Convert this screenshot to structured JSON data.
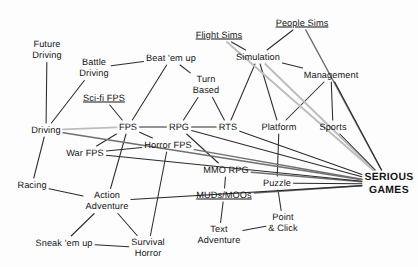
{
  "diagram": {
    "colors": {
      "text": "#141414",
      "edge_dark": "#2b2b2b",
      "edge_mid": "#6f6f6f",
      "edge_light": "#bdbdbd",
      "background": "#fdfdfd"
    },
    "nodes": [
      {
        "id": "future_driving",
        "label": "Future\nDriving",
        "x": 47,
        "y": 50,
        "style": "plain"
      },
      {
        "id": "battle_driving",
        "label": "Battle\nDriving",
        "x": 94,
        "y": 68,
        "style": "plain"
      },
      {
        "id": "beat_em_up",
        "label": "Beat 'em up",
        "x": 171,
        "y": 58,
        "style": "plain"
      },
      {
        "id": "flight_sims",
        "label": "Flight Sims",
        "x": 219,
        "y": 35,
        "style": "underline-partial"
      },
      {
        "id": "people_sims",
        "label": "People Sims",
        "x": 302,
        "y": 23,
        "style": "underline-partial"
      },
      {
        "id": "simulation",
        "label": "Simulation",
        "x": 258,
        "y": 57,
        "style": "plain"
      },
      {
        "id": "management",
        "label": "Management",
        "x": 331,
        "y": 75,
        "style": "plain"
      },
      {
        "id": "turn_based",
        "label": "Turn\nBased",
        "x": 206,
        "y": 85,
        "style": "plain"
      },
      {
        "id": "scifi_fps",
        "label": "Sci-fi FPS",
        "x": 104,
        "y": 98,
        "style": "underline"
      },
      {
        "id": "driving",
        "label": "Driving",
        "x": 46,
        "y": 130,
        "style": "plain"
      },
      {
        "id": "fps",
        "label": "FPS",
        "x": 128,
        "y": 127,
        "style": "plain"
      },
      {
        "id": "rpg",
        "label": "RPG",
        "x": 179,
        "y": 127,
        "style": "plain"
      },
      {
        "id": "rts",
        "label": "RTS",
        "x": 228,
        "y": 127,
        "style": "plain"
      },
      {
        "id": "platform",
        "label": "Platform",
        "x": 279,
        "y": 127,
        "style": "plain"
      },
      {
        "id": "sports",
        "label": "Sports",
        "x": 333,
        "y": 127,
        "style": "plain"
      },
      {
        "id": "war_fps",
        "label": "War FPS",
        "x": 85,
        "y": 153,
        "style": "plain"
      },
      {
        "id": "horror_fps",
        "label": "Horror FPS",
        "x": 168,
        "y": 145,
        "style": "plain"
      },
      {
        "id": "mmo_rpg",
        "label": "MMO RPG",
        "x": 226,
        "y": 170,
        "style": "plain"
      },
      {
        "id": "puzzle",
        "label": "Puzzle",
        "x": 277,
        "y": 183,
        "style": "plain"
      },
      {
        "id": "serious_games",
        "label": "SERIOUS\nGAMES",
        "x": 389,
        "y": 184,
        "style": "hub"
      },
      {
        "id": "racing",
        "label": "Racing",
        "x": 32,
        "y": 185,
        "style": "plain"
      },
      {
        "id": "action_adv",
        "label": "Action\nAdventure",
        "x": 107,
        "y": 201,
        "style": "plain"
      },
      {
        "id": "muds_moos",
        "label": "MUDs/MOOs",
        "x": 224,
        "y": 195,
        "style": "underline"
      },
      {
        "id": "point_click",
        "label": "Point\n& Click",
        "x": 283,
        "y": 223,
        "style": "plain"
      },
      {
        "id": "sneak_em_up",
        "label": "Sneak 'em up",
        "x": 64,
        "y": 243,
        "style": "plain"
      },
      {
        "id": "survival_horror",
        "label": "Survival\nHorror",
        "x": 148,
        "y": 248,
        "style": "plain"
      },
      {
        "id": "text_adv",
        "label": "Text\nAdventure",
        "x": 219,
        "y": 235,
        "style": "plain"
      }
    ],
    "edges": [
      {
        "from": "future_driving",
        "to": "driving",
        "shade": "dark"
      },
      {
        "from": "battle_driving",
        "to": "driving",
        "shade": "dark"
      },
      {
        "from": "battle_driving",
        "to": "beat_em_up",
        "shade": "dark"
      },
      {
        "from": "scifi_fps",
        "to": "fps",
        "shade": "dark"
      },
      {
        "from": "beat_em_up",
        "to": "fps",
        "shade": "dark"
      },
      {
        "from": "beat_em_up",
        "to": "turn_based",
        "shade": "dark"
      },
      {
        "from": "flight_sims",
        "to": "simulation",
        "shade": "dark"
      },
      {
        "from": "people_sims",
        "to": "simulation",
        "shade": "dark"
      },
      {
        "from": "simulation",
        "to": "management",
        "shade": "dark"
      },
      {
        "from": "simulation",
        "to": "rts",
        "shade": "dark"
      },
      {
        "from": "simulation",
        "to": "platform",
        "shade": "dark"
      },
      {
        "from": "turn_based",
        "to": "rpg",
        "shade": "dark"
      },
      {
        "from": "turn_based",
        "to": "rts",
        "shade": "dark"
      },
      {
        "from": "management",
        "to": "sports",
        "shade": "dark"
      },
      {
        "from": "management",
        "to": "platform",
        "shade": "dark"
      },
      {
        "from": "driving",
        "to": "fps",
        "shade": "light"
      },
      {
        "from": "driving",
        "to": "racing",
        "shade": "dark"
      },
      {
        "from": "fps",
        "to": "rpg",
        "shade": "dark"
      },
      {
        "from": "fps",
        "to": "war_fps",
        "shade": "dark"
      },
      {
        "from": "fps",
        "to": "horror_fps",
        "shade": "dark"
      },
      {
        "from": "rpg",
        "to": "rts",
        "shade": "dark"
      },
      {
        "from": "rpg",
        "to": "mmo_rpg",
        "shade": "dark"
      },
      {
        "from": "war_fps",
        "to": "horror_fps",
        "shade": "dark"
      },
      {
        "from": "horror_fps",
        "to": "survival_horror",
        "shade": "dark"
      },
      {
        "from": "mmo_rpg",
        "to": "muds_moos",
        "shade": "dark"
      },
      {
        "from": "muds_moos",
        "to": "text_adv",
        "shade": "dark"
      },
      {
        "from": "racing",
        "to": "action_adv",
        "shade": "dark"
      },
      {
        "from": "action_adv",
        "to": "sneak_em_up",
        "shade": "dark"
      },
      {
        "from": "action_adv",
        "to": "survival_horror",
        "shade": "dark"
      },
      {
        "from": "action_adv",
        "to": "fps",
        "shade": "dark"
      },
      {
        "from": "sneak_em_up",
        "to": "survival_horror",
        "shade": "dark"
      },
      {
        "from": "platform",
        "to": "puzzle",
        "shade": "dark"
      },
      {
        "from": "puzzle",
        "to": "point_click",
        "shade": "dark"
      },
      {
        "from": "point_click",
        "to": "text_adv",
        "shade": "dark"
      },
      {
        "from": "flight_sims",
        "to": "serious_games",
        "shade": "light"
      },
      {
        "from": "simulation",
        "to": "serious_games",
        "shade": "light"
      },
      {
        "from": "people_sims",
        "to": "serious_games",
        "shade": "mid"
      },
      {
        "from": "management",
        "to": "serious_games",
        "shade": "dark"
      },
      {
        "from": "sports",
        "to": "serious_games",
        "shade": "dark"
      },
      {
        "from": "rts",
        "to": "serious_games",
        "shade": "dark"
      },
      {
        "from": "rpg",
        "to": "serious_games",
        "shade": "dark"
      },
      {
        "from": "mmo_rpg",
        "to": "serious_games",
        "shade": "mid"
      },
      {
        "from": "muds_moos",
        "to": "serious_games",
        "shade": "mid"
      },
      {
        "from": "puzzle",
        "to": "serious_games",
        "shade": "dark"
      },
      {
        "from": "action_adv",
        "to": "serious_games",
        "shade": "dark"
      },
      {
        "from": "war_fps",
        "to": "serious_games",
        "shade": "dark"
      },
      {
        "from": "horror_fps",
        "to": "serious_games",
        "shade": "mid"
      },
      {
        "from": "driving",
        "to": "serious_games",
        "shade": "mid"
      }
    ]
  }
}
